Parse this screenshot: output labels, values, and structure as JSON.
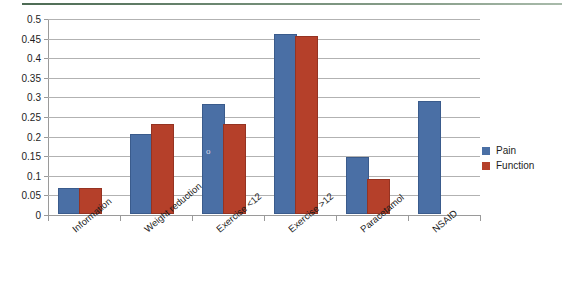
{
  "chart_data": {
    "type": "bar",
    "title": "",
    "subtitle": "",
    "xlabel": "",
    "ylabel": "",
    "categories": [
      "Information",
      "Weight reduction",
      "Exercise <12",
      "Exercise >12",
      "Paracetamol",
      "NSAID"
    ],
    "series": [
      {
        "name": "Pain",
        "color": "#4a6fa5",
        "values": [
          0.06,
          0.2,
          0.275,
          0.455,
          0.14,
          0.283
        ]
      },
      {
        "name": "Function",
        "color": "#b5402a",
        "values": [
          0.06,
          0.225,
          0.225,
          0.45,
          0.085,
          null
        ]
      }
    ],
    "ylim": [
      0,
      0.5
    ],
    "ytick_values": [
      0,
      0.05,
      0.1,
      0.15,
      0.2,
      0.25,
      0.3,
      0.35,
      0.4,
      0.45,
      0.5
    ],
    "ytick_labels": [
      "0",
      "0.05",
      "0.1",
      "0.15",
      "0.2",
      "0.25",
      "0.3",
      "0.35",
      "0.4",
      "0.45",
      "0.5"
    ],
    "grid": "horizontal",
    "legend_position": "right",
    "legend_entries": [
      "Pain",
      "Function"
    ],
    "annotations": [
      {
        "text": "o",
        "series": "Pain",
        "category": "Exercise <12",
        "note": "faint stray ink mark on bar"
      }
    ]
  },
  "colors": {
    "pain": "#4a6fa5",
    "function": "#b5402a",
    "gridline": "#b2b2b2",
    "axis": "#9a9a9a",
    "top_rule": "#4d6b54",
    "text": "#1d1d1d",
    "background": "#ffffff"
  }
}
